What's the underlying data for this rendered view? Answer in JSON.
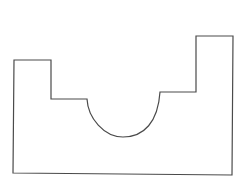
{
  "diagram": {
    "type": "2d-profile-outline",
    "canvas": {
      "width": 247,
      "height": 187
    },
    "background": "#ffffff",
    "stroke_color": "#4a4a4a",
    "vertices": {
      "left_tab_top_left": [
        14,
        60
      ],
      "left_tab_top_right": [
        51,
        60
      ],
      "left_step_inner": [
        51,
        99
      ],
      "arc_start": [
        87,
        99
      ],
      "arc_bottom": [
        123,
        137
      ],
      "arc_end": [
        160,
        92
      ],
      "right_step_inner": [
        196,
        92
      ],
      "right_tab_top_left": [
        196,
        36
      ],
      "right_tab_top_right": [
        233,
        36
      ],
      "bottom_right": [
        232,
        175
      ],
      "bottom_left": [
        13,
        173
      ]
    },
    "arc": {
      "shape": "semicircle",
      "radius_x": 36,
      "radius_y": 38
    }
  }
}
